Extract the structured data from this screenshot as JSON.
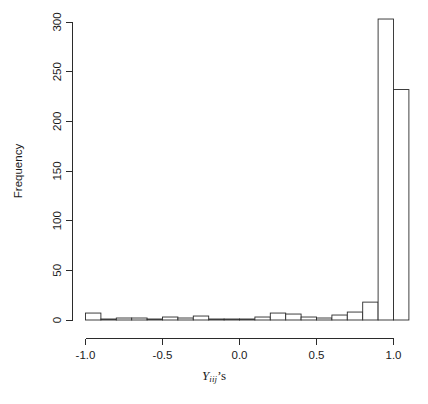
{
  "chart_data": {
    "type": "bar",
    "title": "",
    "subtitle": "",
    "xlabel": "Y_iij's",
    "xlabel_parts": {
      "variable": "Y",
      "subscript": "iij",
      "suffix": "’s"
    },
    "ylabel": "Frequency",
    "xlim": [
      -1.05,
      1.15
    ],
    "ylim": [
      0,
      310
    ],
    "xticks": [
      -1.0,
      -0.5,
      0.0,
      0.5,
      1.0
    ],
    "xticklabels": [
      "-1.0",
      "-0.5",
      "0.0",
      "0.5",
      "1.0"
    ],
    "yticks": [
      0,
      50,
      100,
      150,
      200,
      250,
      300
    ],
    "yticklabels": [
      "0",
      "50",
      "100",
      "150",
      "200",
      "250",
      "300"
    ],
    "grid": false,
    "legend": null,
    "bin_width": 0.1,
    "bin_edges": [
      -1.0,
      -0.9,
      -0.8,
      -0.7,
      -0.6,
      -0.5,
      -0.4,
      -0.3,
      -0.2,
      -0.1,
      0.0,
      0.1,
      0.2,
      0.3,
      0.4,
      0.5,
      0.6,
      0.7,
      0.8,
      0.9,
      1.0,
      1.1
    ],
    "categories": [
      "-1.0 to -0.9",
      "-0.9 to -0.8",
      "-0.8 to -0.7",
      "-0.7 to -0.6",
      "-0.6 to -0.5",
      "-0.5 to -0.4",
      "-0.4 to -0.3",
      "-0.3 to -0.2",
      "-0.2 to -0.1",
      "-0.1 to 0.0",
      "0.0 to 0.1",
      "0.1 to 0.2",
      "0.2 to 0.3",
      "0.3 to 0.4",
      "0.4 to 0.5",
      "0.5 to 0.6",
      "0.6 to 0.7",
      "0.7 to 0.8",
      "0.8 to 0.9",
      "0.9 to 1.0",
      "1.0 to 1.1"
    ],
    "values": [
      7,
      1,
      2,
      2,
      1,
      3,
      2,
      4,
      1,
      1,
      1,
      3,
      7,
      6,
      3,
      2,
      5,
      8,
      18,
      303,
      232
    ],
    "colors": {
      "bar_fill": "#ffffff",
      "bar_stroke": "#2b2b2b",
      "axis": "#2b2b2b",
      "text": "#1a1a1a",
      "background": "#ffffff"
    }
  }
}
